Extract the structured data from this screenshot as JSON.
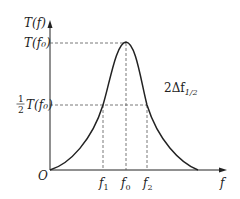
{
  "diagram": {
    "type": "resonance-curve",
    "y_axis_label": "T(f)",
    "x_axis_label": "f",
    "origin_label": "O",
    "peak_label": "T(f₀)",
    "half_label_fraction": "1/2",
    "half_label_frac_num": "1",
    "half_label_frac_den": "2",
    "half_label_text": "T(f₀)",
    "bandwidth_label": "2Δf",
    "bandwidth_subscript": "1/2",
    "x_ticks": [
      {
        "base": "f",
        "sub": "1"
      },
      {
        "base": "f",
        "sub": "0"
      },
      {
        "base": "f",
        "sub": "2"
      }
    ],
    "colors": {
      "line": "#222222",
      "dash": "#555555"
    }
  }
}
